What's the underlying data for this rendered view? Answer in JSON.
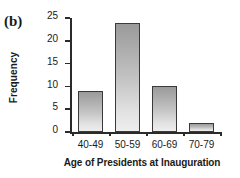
{
  "panel": {
    "label": "(b)"
  },
  "chart_data": {
    "type": "bar",
    "title": "",
    "subtitle": "",
    "xlabel": "Age of Presidents at Inauguration",
    "ylabel": "Frequency",
    "categories": [
      "40-49",
      "50-59",
      "60-69",
      "70-79"
    ],
    "values": [
      9,
      24,
      10,
      2
    ],
    "ylim": [
      0,
      25
    ],
    "yticks": [
      0,
      5,
      10,
      15,
      20,
      25
    ],
    "ytick_labels": [
      "0",
      "5",
      "10",
      "15",
      "20",
      "25"
    ],
    "grid": false,
    "legend": null,
    "annotations": [],
    "bar_fill": "#c4c4c4",
    "bar_edge": "#3a3a3a",
    "axis_color": "#2b2b2b"
  }
}
